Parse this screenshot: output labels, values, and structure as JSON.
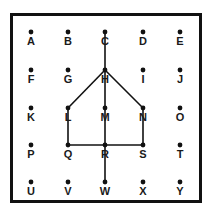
{
  "diagram": {
    "type": "dot-grid-figure",
    "grid": {
      "columns": 5,
      "rows": 5,
      "column_x": [
        31,
        68,
        105,
        143,
        180
      ],
      "row_y": [
        32,
        70,
        108,
        145,
        182
      ]
    },
    "points": [
      {
        "label": "A",
        "col": 0,
        "row": 0
      },
      {
        "label": "B",
        "col": 1,
        "row": 0
      },
      {
        "label": "C",
        "col": 2,
        "row": 0
      },
      {
        "label": "D",
        "col": 3,
        "row": 0
      },
      {
        "label": "E",
        "col": 4,
        "row": 0
      },
      {
        "label": "F",
        "col": 0,
        "row": 1
      },
      {
        "label": "G",
        "col": 1,
        "row": 1
      },
      {
        "label": "H",
        "col": 2,
        "row": 1
      },
      {
        "label": "I",
        "col": 3,
        "row": 1
      },
      {
        "label": "J",
        "col": 4,
        "row": 1
      },
      {
        "label": "K",
        "col": 0,
        "row": 2
      },
      {
        "label": "L",
        "col": 1,
        "row": 2
      },
      {
        "label": "M",
        "col": 2,
        "row": 2
      },
      {
        "label": "N",
        "col": 3,
        "row": 2
      },
      {
        "label": "O",
        "col": 4,
        "row": 2
      },
      {
        "label": "P",
        "col": 0,
        "row": 3
      },
      {
        "label": "Q",
        "col": 1,
        "row": 3
      },
      {
        "label": "R",
        "col": 2,
        "row": 3
      },
      {
        "label": "S",
        "col": 3,
        "row": 3
      },
      {
        "label": "T",
        "col": 4,
        "row": 3
      },
      {
        "label": "U",
        "col": 0,
        "row": 4
      },
      {
        "label": "V",
        "col": 1,
        "row": 4
      },
      {
        "label": "W",
        "col": 2,
        "row": 4
      },
      {
        "label": "X",
        "col": 3,
        "row": 4
      },
      {
        "label": "Y",
        "col": 4,
        "row": 4
      }
    ],
    "segments": [
      [
        "C",
        "H"
      ],
      [
        "H",
        "M"
      ],
      [
        "M",
        "R"
      ],
      [
        "R",
        "W"
      ],
      [
        "H",
        "L"
      ],
      [
        "H",
        "N"
      ],
      [
        "L",
        "Q"
      ],
      [
        "N",
        "S"
      ],
      [
        "Q",
        "R"
      ],
      [
        "R",
        "S"
      ]
    ],
    "colors": {
      "ink": "#111111",
      "background": "#ffffff"
    }
  }
}
